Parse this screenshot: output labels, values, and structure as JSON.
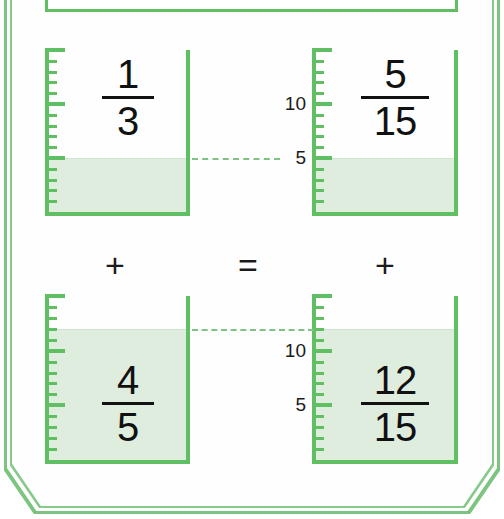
{
  "theme": {
    "accent_green": "#5fbf62",
    "frame_green": "#7cc47f",
    "liquid_green": "#dfeddf",
    "text_black": "#111111",
    "background": "#ffffff"
  },
  "diagram": {
    "concept": "1/3 + 4/5 = 5/15 + 12/15"
  },
  "operators": {
    "left_plus": "+",
    "equals": "=",
    "right_plus": "+"
  },
  "beakers": [
    {
      "id": "top-left",
      "numerator": "1",
      "denominator": "3",
      "fill_value": 5,
      "scale_max": 15,
      "scale_labels": [],
      "has_scale_numbers": false
    },
    {
      "id": "top-right",
      "numerator": "5",
      "denominator": "15",
      "fill_value": 5,
      "scale_max": 15,
      "scale_labels": [
        {
          "value": 10,
          "text": "10"
        },
        {
          "value": 5,
          "text": "5"
        }
      ],
      "has_scale_numbers": true
    },
    {
      "id": "bottom-left",
      "numerator": "4",
      "denominator": "5",
      "fill_value": 12,
      "scale_max": 15,
      "scale_labels": [],
      "has_scale_numbers": false
    },
    {
      "id": "bottom-right",
      "numerator": "12",
      "denominator": "15",
      "fill_value": 12,
      "scale_max": 15,
      "scale_labels": [
        {
          "value": 10,
          "text": "10"
        },
        {
          "value": 5,
          "text": "5"
        }
      ],
      "has_scale_numbers": true
    }
  ],
  "chart_data": {
    "type": "bar",
    "categories": [
      "1/3",
      "5/15",
      "4/5",
      "12/15"
    ],
    "values": [
      5,
      5,
      12,
      12
    ],
    "xlabel": "",
    "ylabel": "",
    "ylim": [
      0,
      15
    ],
    "grid": true,
    "legend": "none",
    "annotations": [
      "+",
      "=",
      "+",
      "10",
      "5",
      "10",
      "5"
    ]
  }
}
